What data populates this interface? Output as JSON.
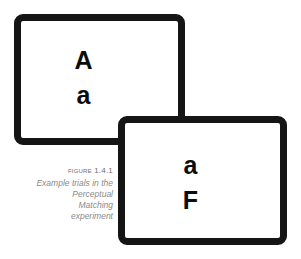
{
  "figure": {
    "background_color": "#ffffff",
    "caption": {
      "label": "Figure 1.4.1",
      "body": "Example trials in the Perceptual Matching experiment",
      "label_color": "#6f6f6f",
      "body_color": "#8a8a8a"
    },
    "cards": [
      {
        "id": "card-1",
        "name": "stimulus-card-back",
        "border_color": "#151515",
        "fill_color": "#ffffff",
        "letters": {
          "top": "A",
          "bottom": "a"
        }
      },
      {
        "id": "card-2",
        "name": "stimulus-card-front",
        "border_color": "#151515",
        "fill_color": "#ffffff",
        "letters": {
          "top": "a",
          "bottom": "F"
        }
      }
    ]
  }
}
